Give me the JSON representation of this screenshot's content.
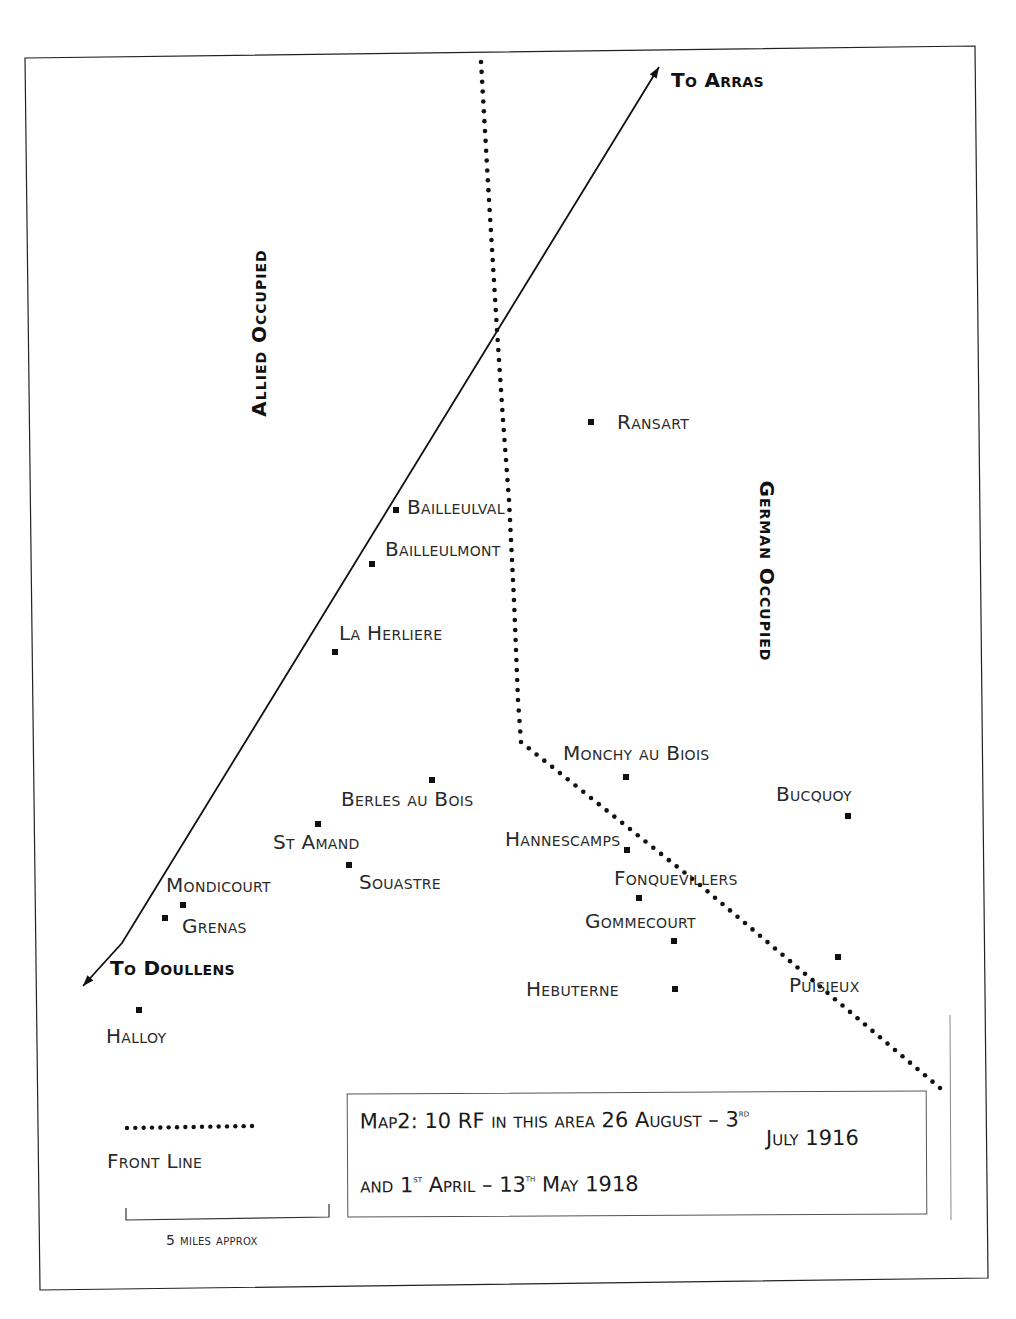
{
  "map": {
    "frame": {
      "corners": [
        [
          25,
          58
        ],
        [
          975,
          46
        ],
        [
          988,
          1278
        ],
        [
          40,
          1290
        ]
      ],
      "color": "#222222"
    },
    "zones": {
      "allied": {
        "label": "Allied Occupied",
        "x": 258,
        "y": 333,
        "rotate": -90
      },
      "german": {
        "label": "German Occupied",
        "x": 767,
        "y": 571,
        "rotate": 90
      }
    },
    "road": {
      "points": [
        [
          659,
          67
        ],
        [
          122,
          943
        ],
        [
          83,
          986
        ]
      ],
      "to_arras": {
        "label": "To Arras",
        "x": 671,
        "y": 70
      },
      "to_doullens": {
        "label": "To Doullens",
        "x": 110,
        "y": 958
      }
    },
    "front_line": {
      "points": [
        [
          481,
          62
        ],
        [
          489,
          200
        ],
        [
          497,
          330
        ],
        [
          503,
          420
        ],
        [
          509,
          500
        ],
        [
          514,
          600
        ],
        [
          518,
          700
        ],
        [
          521,
          742
        ],
        [
          700,
          885
        ],
        [
          940,
          1088
        ]
      ],
      "color": "#111111"
    },
    "towns": [
      {
        "name": "Ransart",
        "marker": [
          591,
          422
        ],
        "label_pos": [
          617,
          412
        ]
      },
      {
        "name": "Bailleulval",
        "marker": [
          396,
          510
        ],
        "label_pos": [
          407,
          497
        ]
      },
      {
        "name": "Bailleulmont",
        "marker": [
          372,
          564
        ],
        "label_pos": [
          385,
          539
        ]
      },
      {
        "name": "La Herliere",
        "marker": [
          335,
          652
        ],
        "label_pos": [
          339,
          623
        ]
      },
      {
        "name": "Monchy au Biois",
        "marker": [
          626,
          777
        ],
        "label_pos": [
          563,
          743
        ]
      },
      {
        "name": "Berles au Bois",
        "marker": [
          432,
          780
        ],
        "label_pos": [
          341,
          789
        ]
      },
      {
        "name": "Bucquoy",
        "marker": [
          848,
          816
        ],
        "label_pos": [
          776,
          784
        ]
      },
      {
        "name": "St Amand",
        "marker": [
          318,
          824
        ],
        "label_pos": [
          273,
          832
        ]
      },
      {
        "name": "Hannescamps",
        "marker": [
          627,
          850
        ],
        "label_pos": [
          505,
          829
        ]
      },
      {
        "name": "Souastre",
        "marker": [
          349,
          865
        ],
        "label_pos": [
          359,
          872
        ]
      },
      {
        "name": "Fonquevillers",
        "marker": [
          639,
          898
        ],
        "label_pos": [
          614,
          868
        ]
      },
      {
        "name": "Mondicourt",
        "marker": [
          183,
          905
        ],
        "label_pos": [
          166,
          875
        ]
      },
      {
        "name": "Grenas",
        "marker": [
          165,
          918
        ],
        "label_pos": [
          182,
          916
        ]
      },
      {
        "name": "Gommecourt",
        "marker": [
          674,
          941
        ],
        "label_pos": [
          585,
          911
        ]
      },
      {
        "name": "Puisieux",
        "marker": [
          838,
          957
        ],
        "label_pos": [
          789,
          975
        ]
      },
      {
        "name": "Hebuterne",
        "marker": [
          675,
          989
        ],
        "label_pos": [
          526,
          979
        ]
      },
      {
        "name": "Halloy",
        "marker": [
          139,
          1010
        ],
        "label_pos": [
          106,
          1026
        ]
      }
    ],
    "legend": {
      "front_line_label": "Front Line",
      "front_line_sample": [
        [
          127,
          1128
        ],
        [
          252,
          1126
        ]
      ],
      "scale_bar": {
        "points": [
          [
            126,
            1208
          ],
          [
            126,
            1220
          ],
          [
            329,
            1217
          ],
          [
            329,
            1204
          ]
        ],
        "label": "5 miles approx"
      }
    },
    "caption": {
      "line1": "Map2:  10 RF in this area 26 August  – 3",
      "line1_sup": "rd",
      "line2": "July 1916",
      "line3_a": "and 1",
      "line3_sup1": "st",
      "line3_b": " April  – 13",
      "line3_sup2": "th",
      "line3_c": " May 1918"
    },
    "side_rule": {
      "x": 950,
      "y1": 1015,
      "y2": 1220,
      "color": "#888888"
    }
  }
}
